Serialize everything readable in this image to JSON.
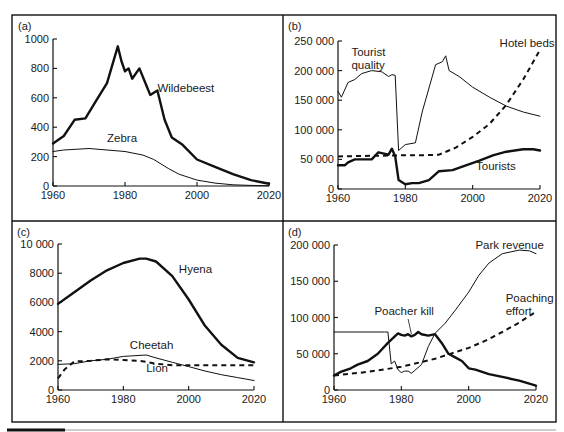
{
  "figure": {
    "footer_bar": {
      "black_color": "#111111",
      "rule_color": "#9a9a9a"
    }
  },
  "chart_data": [
    {
      "id": "a",
      "panel_label": "(a)",
      "type": "line",
      "title": "",
      "xlabel": "",
      "ylabel": "",
      "xlim": [
        1960,
        2020
      ],
      "ylim": [
        0,
        1000
      ],
      "xticks": [
        1960,
        1980,
        2000,
        2020
      ],
      "yticks": [
        0,
        200,
        400,
        600,
        800,
        1000
      ],
      "ytick_labels": [
        "0",
        "200",
        "400",
        "600",
        "800",
        "1000"
      ],
      "grid": false,
      "legend": "inline labels",
      "series": [
        {
          "name": "Wildebeest",
          "style": "thick",
          "label_pos": [
            1989,
            640
          ],
          "x": [
            1960,
            1963,
            1966,
            1969,
            1972,
            1975,
            1978,
            1979,
            1980,
            1981,
            1982,
            1984,
            1986,
            1987,
            1989,
            1991,
            1993,
            1996,
            2000,
            2005,
            2010,
            2015,
            2020
          ],
          "y": [
            290,
            340,
            450,
            460,
            580,
            700,
            950,
            850,
            780,
            800,
            730,
            800,
            680,
            620,
            650,
            450,
            330,
            280,
            180,
            130,
            80,
            40,
            15
          ]
        },
        {
          "name": "Zebra",
          "style": "thin",
          "label_pos": [
            1975,
            300
          ],
          "x": [
            1960,
            1963,
            1970,
            1975,
            1980,
            1985,
            1988,
            1992,
            1995,
            2000,
            2005,
            2010,
            2015,
            2020
          ],
          "y": [
            235,
            245,
            255,
            245,
            235,
            210,
            180,
            120,
            80,
            40,
            20,
            8,
            4,
            2
          ]
        }
      ]
    },
    {
      "id": "b",
      "panel_label": "(b)",
      "type": "line",
      "title": "",
      "xlabel": "",
      "ylabel": "",
      "xlim": [
        1960,
        2020
      ],
      "ylim": [
        0,
        250000
      ],
      "xticks": [
        1960,
        1980,
        2000,
        2020
      ],
      "yticks": [
        0,
        50000,
        100000,
        150000,
        200000,
        250000
      ],
      "ytick_labels": [
        "0",
        "50 000",
        "100 000",
        "150 000",
        "200 000",
        "250 000"
      ],
      "grid": false,
      "legend": "inline labels",
      "series": [
        {
          "name": "Tourist quality",
          "label_lines": [
            "Tourist",
            "quality"
          ],
          "style": "thin",
          "label_pos": [
            1964,
            225000
          ],
          "x": [
            1960,
            1961,
            1963,
            1965,
            1967,
            1970,
            1973,
            1975,
            1976,
            1977,
            1978,
            1980,
            1983,
            1985,
            1989,
            1991,
            1992,
            1993,
            1996,
            2000,
            2005,
            2010,
            2015,
            2020
          ],
          "y": [
            165000,
            155000,
            180000,
            185000,
            195000,
            200000,
            198000,
            190000,
            193000,
            192000,
            65000,
            75000,
            78000,
            130000,
            210000,
            215000,
            225000,
            200000,
            190000,
            172000,
            155000,
            140000,
            130000,
            123000
          ]
        },
        {
          "name": "Hotel beds",
          "style": "dashed",
          "label_pos": [
            2008,
            240000
          ],
          "x": [
            1960,
            1970,
            1980,
            1985,
            1990,
            1995,
            2000,
            2005,
            2010,
            2015,
            2020
          ],
          "y": [
            55000,
            56000,
            57000,
            57000,
            58000,
            70000,
            88000,
            110000,
            142000,
            185000,
            235000
          ]
        },
        {
          "name": "Tourists",
          "style": "thick",
          "label_pos": [
            2001,
            32000
          ],
          "x": [
            1960,
            1962,
            1963,
            1965,
            1970,
            1972,
            1975,
            1976,
            1977,
            1978,
            1980,
            1982,
            1984,
            1987,
            1990,
            1994,
            1998,
            2002,
            2006,
            2010,
            2015,
            2018,
            2020
          ],
          "y": [
            40000,
            40000,
            45000,
            50000,
            50000,
            62000,
            58000,
            68000,
            55000,
            15000,
            8000,
            10000,
            10000,
            15000,
            30000,
            32000,
            40000,
            48000,
            57000,
            63000,
            67000,
            67000,
            65000
          ]
        }
      ]
    },
    {
      "id": "c",
      "panel_label": "(c)",
      "type": "line",
      "title": "",
      "xlabel": "",
      "ylabel": "",
      "xlim": [
        1960,
        2020
      ],
      "ylim": [
        0,
        10000
      ],
      "xticks": [
        1960,
        1980,
        2000,
        2020
      ],
      "yticks": [
        0,
        2000,
        4000,
        6000,
        8000,
        10000
      ],
      "ytick_labels": [
        "0",
        "2000",
        "4000",
        "6000",
        "8000",
        "10 000"
      ],
      "grid": false,
      "legend": "inline labels",
      "series": [
        {
          "name": "Hyena",
          "style": "thick",
          "label_pos": [
            1997,
            8000
          ],
          "x": [
            1960,
            1965,
            1970,
            1975,
            1980,
            1985,
            1987,
            1990,
            1995,
            2000,
            2005,
            2010,
            2015,
            2020
          ],
          "y": [
            5900,
            6700,
            7500,
            8200,
            8700,
            9000,
            9000,
            8800,
            7800,
            6200,
            4400,
            3100,
            2200,
            1900
          ]
        },
        {
          "name": "Cheetah",
          "style": "thin",
          "label_pos": [
            1982,
            2800
          ],
          "x": [
            1960,
            1965,
            1970,
            1975,
            1980,
            1987,
            1990,
            1995,
            2000,
            2005,
            2010,
            2015,
            2020
          ],
          "y": [
            1750,
            1800,
            2000,
            2100,
            2300,
            2400,
            2200,
            1900,
            1600,
            1300,
            1050,
            850,
            650
          ]
        },
        {
          "name": "Lion",
          "style": "dashed",
          "label_pos": [
            1987,
            1200
          ],
          "x": [
            1960,
            1962,
            1965,
            1970,
            1975,
            1980,
            1985,
            1990,
            1995,
            2000,
            2005,
            2010,
            2015,
            2020
          ],
          "y": [
            800,
            1400,
            1950,
            2000,
            2100,
            2050,
            2000,
            1800,
            1700,
            1700,
            1700,
            1700,
            1700,
            1700
          ]
        }
      ]
    },
    {
      "id": "d",
      "panel_label": "(d)",
      "type": "line",
      "title": "",
      "xlabel": "",
      "ylabel": "",
      "xlim": [
        1960,
        2020
      ],
      "ylim": [
        0,
        200000
      ],
      "xticks": [
        1960,
        1980,
        2000,
        2020
      ],
      "yticks": [
        0,
        50000,
        100000,
        150000,
        200000
      ],
      "ytick_labels": [
        "0",
        "50 000",
        "100 000",
        "150 000",
        "200 000"
      ],
      "grid": false,
      "legend": "inline labels",
      "series": [
        {
          "name": "Park revenue",
          "style": "thin",
          "label_pos": [
            2002,
            195000
          ],
          "x": [
            1960,
            1975,
            1976,
            1977,
            1978,
            1979,
            1980,
            1981,
            1982,
            1983,
            1984,
            1986,
            1988,
            1990,
            1993,
            1996,
            2000,
            2003,
            2006,
            2010,
            2015,
            2018,
            2020
          ],
          "y": [
            80000,
            80000,
            80000,
            36000,
            40000,
            28000,
            24000,
            26000,
            26000,
            23000,
            27000,
            35000,
            60000,
            78000,
            92000,
            110000,
            135000,
            158000,
            175000,
            188000,
            193000,
            192000,
            188000
          ]
        },
        {
          "name": "Poacher kill",
          "style": "thick",
          "label_pos": [
            1972,
            103000
          ],
          "label_leader": [
            [
              1982,
              98000
            ],
            [
              1983,
              77000
            ]
          ],
          "x": [
            1960,
            1962,
            1965,
            1967,
            1970,
            1973,
            1976,
            1979,
            1980,
            1981,
            1982,
            1983,
            1984,
            1985,
            1986,
            1988,
            1990,
            1992,
            1994,
            1996,
            1998,
            2000,
            2002,
            2006,
            2010,
            2015,
            2020
          ],
          "y": [
            20000,
            25000,
            30000,
            35000,
            40000,
            50000,
            65000,
            78000,
            76000,
            75000,
            77000,
            74000,
            76000,
            80000,
            77000,
            75000,
            77000,
            65000,
            50000,
            45000,
            40000,
            30000,
            28000,
            22000,
            18000,
            13000,
            6000
          ]
        },
        {
          "name": "Poaching effort",
          "label_lines": [
            "Poaching",
            "effort"
          ],
          "style": "dashed",
          "label_pos": [
            2011,
            122000
          ],
          "x": [
            1960,
            1970,
            1980,
            1990,
            2000,
            2005,
            2010,
            2015,
            2020
          ],
          "y": [
            20000,
            25000,
            32000,
            43000,
            58000,
            68000,
            80000,
            93000,
            108000
          ]
        }
      ]
    }
  ]
}
